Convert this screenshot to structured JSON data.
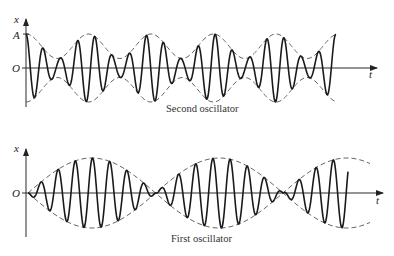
{
  "figure": {
    "panels": [
      {
        "id": "second",
        "caption": "Second oscillator",
        "y_axis_label": "x",
        "x_axis_label": "t",
        "tick_A": "A",
        "origin_label": "O",
        "geometry": {
          "axis_x": 26,
          "axis_top": 19,
          "axis_bottom": 107,
          "baseline_y": 68,
          "t_end": 377,
          "amp_px": 34,
          "signal_start": 26,
          "signal_end": 336,
          "envelope_end": 336
        },
        "envelope": {
          "type": "cos_beat",
          "min_ratio": 0.28,
          "period_px": 125,
          "phase_max_x": 26
        },
        "carrier_period_px": 17.2
      },
      {
        "id": "first",
        "caption": "First oscillator",
        "y_axis_label": "x",
        "x_axis_label": "t",
        "origin_label": "O",
        "geometry": {
          "axis_x": 26,
          "axis_top": 149,
          "axis_bottom": 237,
          "baseline_y": 193,
          "t_end": 383,
          "amp_px": 35,
          "signal_start": 28,
          "signal_end": 348,
          "envelope_end": 370
        },
        "envelope": {
          "type": "abs_sin_beat",
          "node_x": 28,
          "half_period_px": 127.5
        },
        "carrier_period_px": 17.2
      }
    ],
    "colors": {
      "line": "#1a1a1a",
      "axis": "#2a2a2a",
      "dash": "#555555"
    }
  }
}
